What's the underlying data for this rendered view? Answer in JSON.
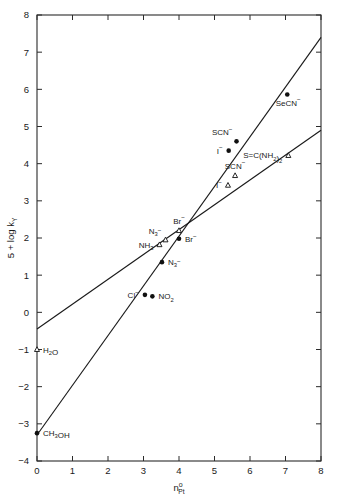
{
  "chart_data": {
    "type": "scatter",
    "title": "",
    "xlabel": "n°Pt",
    "xlabel_parts": {
      "base": "n",
      "sup": "o",
      "sub": "Pt"
    },
    "ylabel": "5 + log kY",
    "ylabel_parts": {
      "base": "5 + log k",
      "sub": "Y"
    },
    "xlim": [
      0,
      8
    ],
    "ylim": [
      -4,
      8
    ],
    "xticks": [
      "0",
      "1",
      "2",
      "3",
      "4",
      "5",
      "6",
      "7",
      "8"
    ],
    "yticks": [
      "-4",
      "-3",
      "-2",
      "-1",
      "0",
      "1",
      "2",
      "3",
      "4",
      "5",
      "6",
      "7",
      "8"
    ],
    "grid": false,
    "legend": "none",
    "series": [
      {
        "name": "filled-circles",
        "marker": "filled-circle",
        "points": [
          {
            "label": "CH3OH",
            "label_html": "CH<sub>3</sub>OH",
            "x": 0.0,
            "y": -3.25,
            "label_pos": "right"
          },
          {
            "label": "Cl-",
            "label_html": "Cl<sup>-</sup>",
            "x": 3.04,
            "y": 0.47,
            "label_pos": "left"
          },
          {
            "label": "NO2",
            "label_html": "NO<sub>2</sub>",
            "x": 3.25,
            "y": 0.43,
            "label_pos": "right"
          },
          {
            "label": "N3-",
            "label_html": "N<sub>3</sub><sup>-</sup>",
            "x": 3.52,
            "y": 1.35,
            "label_pos": "right"
          },
          {
            "label": "Br-",
            "label_html": "Br<sup>-</sup>",
            "x": 4.0,
            "y": 1.98,
            "label_pos": "right"
          },
          {
            "label": "I-",
            "label_html": "I<sup>-</sup>",
            "x": 5.4,
            "y": 4.35,
            "label_pos": "left"
          },
          {
            "label": "SCN-",
            "label_html": "SCN<sup>-</sup>",
            "x": 5.62,
            "y": 4.6,
            "label_pos": "above-left"
          },
          {
            "label": "SeCN-",
            "label_html": "SeCN<sup>-</sup>",
            "x": 7.05,
            "y": 5.86,
            "label_pos": "below"
          }
        ]
      },
      {
        "name": "open-triangles",
        "marker": "open-triangle",
        "points": [
          {
            "label": "H2O",
            "label_html": "H<sub>2</sub>O",
            "x": 0.0,
            "y": -1.0,
            "label_pos": "right"
          },
          {
            "label": "NH3",
            "label_html": "NH<sub>3</sub>",
            "x": 3.45,
            "y": 1.82,
            "label_pos": "left"
          },
          {
            "label": "N3-",
            "label_html": "N<sub>3</sub><sup>-</sup>",
            "x": 3.62,
            "y": 1.95,
            "label_pos": "above-left"
          },
          {
            "label": "Br-",
            "label_html": "Br<sup>-</sup>",
            "x": 4.0,
            "y": 2.2,
            "label_pos": "above"
          },
          {
            "label": "I-",
            "label_html": "I<sup>-</sup>",
            "x": 5.38,
            "y": 3.42,
            "label_pos": "left"
          },
          {
            "label": "SCN-",
            "label_html": "SCN<sup>-</sup>",
            "x": 5.58,
            "y": 3.68,
            "label_pos": "above"
          },
          {
            "label": "S=C(NH2)2",
            "label_html": "S=C(NH<sub>2</sub>)<sub>2</sub>",
            "x": 7.08,
            "y": 4.22,
            "label_pos": "left"
          }
        ]
      }
    ],
    "lines": [
      {
        "name": "steep-fit",
        "x0": 0.0,
        "y0": -3.3,
        "x1": 8.0,
        "y1": 7.4
      },
      {
        "name": "shallow-fit",
        "x0": 0.0,
        "y0": -0.45,
        "x1": 8.0,
        "y1": 4.9
      }
    ]
  }
}
